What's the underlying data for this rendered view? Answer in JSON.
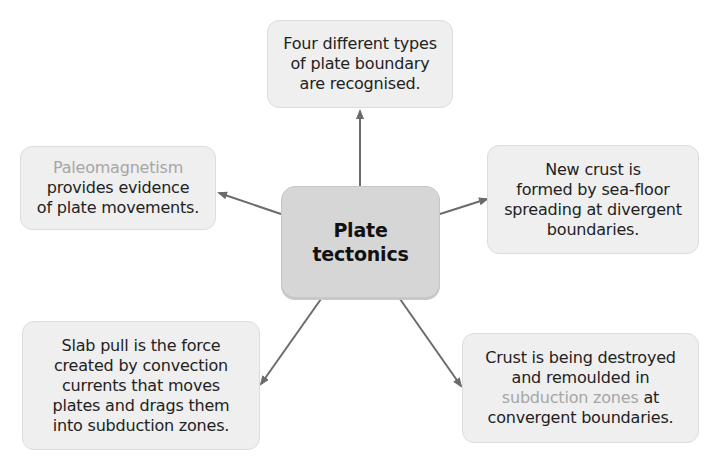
{
  "center": {
    "line1": "Plate",
    "line2": "tectonics"
  },
  "nodes": {
    "top": {
      "lines": [
        "Four different types",
        "of plate boundary",
        "are recognised."
      ]
    },
    "left": {
      "highlight": "Paleomagnetism",
      "lines": [
        "provides evidence",
        "of plate movements."
      ]
    },
    "right": {
      "lines": [
        "New crust is",
        "formed by sea-floor",
        "spreading at divergent",
        "boundaries."
      ]
    },
    "bottom_left": {
      "lines": [
        "Slab pull is the force",
        "created by convection",
        "currents that moves",
        "plates and drags them",
        "into subduction zones."
      ]
    },
    "bottom_right": {
      "line1": "Crust is being destroyed",
      "line2": "and remoulded in",
      "highlight": "subduction zones",
      "line3_rest": " at",
      "line4": "convergent boundaries."
    }
  },
  "colors": {
    "node_fill": "#efefef",
    "center_fill": "#d6d6d6",
    "highlight_text": "#a6a6a6",
    "arrow": "#6b6b6b"
  }
}
